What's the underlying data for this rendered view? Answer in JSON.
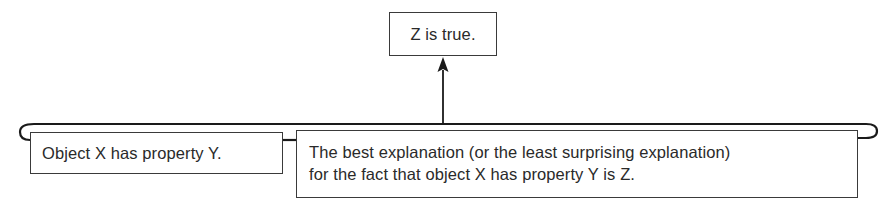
{
  "diagram": {
    "type": "argument-structure",
    "conclusion": {
      "text": "Z is true."
    },
    "premises": [
      {
        "text": "Object X has property Y."
      },
      {
        "lines": [
          "The best explanation (or the least surprising explanation)",
          "for the fact that object X has property Y is Z."
        ]
      }
    ],
    "edges": [
      {
        "from": "premises-group",
        "to": "conclusion",
        "style": "arrow"
      }
    ],
    "colors": {
      "line": "#1a1a1a",
      "box_border": "#3a3a3a",
      "text": "#2a2a2a",
      "background": "#ffffff"
    }
  }
}
